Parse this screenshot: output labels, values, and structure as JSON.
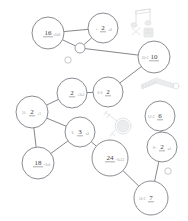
{
  "diagram": {
    "type": "node-link-graph",
    "background_color": "#ffffff",
    "node_stroke_color": "#7d7f86",
    "edge_color": "#6e7076",
    "text_color": "#3f4146",
    "note_color": "#9a9ca2"
  },
  "nodes": [
    {
      "id": "n16",
      "value": "16",
      "note": "x3=8",
      "cx": 48,
      "cy": 33,
      "r": 16
    },
    {
      "id": "n2a",
      "value": "2",
      "note_left": "+",
      "note": "=4",
      "cx": 103,
      "cy": 28,
      "r": 15
    },
    {
      "id": "nhub",
      "value": "",
      "note": "",
      "cx": 80,
      "cy": 48,
      "r": 5
    },
    {
      "id": "n10",
      "value": "10",
      "note_left": "20÷2",
      "note": "",
      "cx": 154,
      "cy": 57,
      "r": 16
    },
    {
      "id": "n2b",
      "value": "2",
      "note": "+3=1",
      "cx": 72,
      "cy": 93,
      "r": 15
    },
    {
      "id": "n2c",
      "value": "2",
      "note_left": "6÷3",
      "note": "",
      "cx": 108,
      "cy": 92,
      "r": 15
    },
    {
      "id": "n2d",
      "value": "2",
      "note_left": "10-",
      "note": "+1",
      "cx": 32,
      "cy": 112,
      "r": 16
    },
    {
      "id": "n3",
      "value": "3",
      "note_left": "6-",
      "note": "=4",
      "cx": 80,
      "cy": 132,
      "r": 15
    },
    {
      "id": "n18",
      "value": "18",
      "note": "÷3=6",
      "cx": 38,
      "cy": 163,
      "r": 16
    },
    {
      "id": "n24",
      "value": "24",
      "note": "÷3=12",
      "cx": 110,
      "cy": 158,
      "r": 18
    },
    {
      "id": "n6",
      "value": "6",
      "note_left": "12÷2",
      "note": "",
      "cx": 160,
      "cy": 116,
      "r": 15
    },
    {
      "id": "n2e",
      "value": "2",
      "note_left": "8÷",
      "note": "=4",
      "cx": 162,
      "cy": 147,
      "r": 15
    },
    {
      "id": "n7",
      "value": "7",
      "note_left": "14÷2",
      "note": "",
      "cx": 151,
      "cy": 198,
      "r": 17
    }
  ],
  "tiny_nodes": [
    {
      "id": "t1",
      "cx": 68,
      "cy": 60,
      "r": 3.2
    },
    {
      "id": "t2",
      "cx": 168,
      "cy": 171,
      "r": 3.2
    }
  ],
  "edges": [
    {
      "from": "n16",
      "to": "n2a"
    },
    {
      "from": "n16",
      "to": "nhub"
    },
    {
      "from": "nhub",
      "to": "n2a"
    },
    {
      "from": "nhub",
      "to": "n10"
    },
    {
      "from": "n10",
      "to": "n2c"
    },
    {
      "from": "n2c",
      "to": "n2b"
    },
    {
      "from": "n2b",
      "to": "n2d"
    },
    {
      "from": "n2d",
      "to": "n3"
    },
    {
      "from": "n2d",
      "to": "n18"
    },
    {
      "from": "n3",
      "to": "n18"
    },
    {
      "from": "n3",
      "to": "n24"
    },
    {
      "from": "n24",
      "to": "n7"
    },
    {
      "from": "n6",
      "to": "n2e"
    },
    {
      "from": "n2e",
      "to": "n7"
    }
  ],
  "sketch_objects": [
    {
      "id": "music-note-sketch",
      "label": "music-notes",
      "x": 130,
      "y": 8
    },
    {
      "id": "comb-sketch",
      "label": "comb",
      "x": 140,
      "y": 76
    },
    {
      "id": "keys-sketch",
      "label": "keys",
      "x": 102,
      "y": 110
    }
  ]
}
